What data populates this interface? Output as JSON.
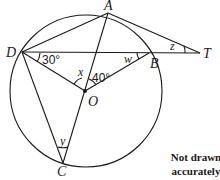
{
  "diagram": {
    "type": "circle-geometry",
    "colors": {
      "stroke": "#1a1a1a",
      "background": "#ffffff"
    },
    "points": {
      "A": {
        "label": "A"
      },
      "B": {
        "label": "B"
      },
      "C": {
        "label": "C"
      },
      "D": {
        "label": "D"
      },
      "O": {
        "label": "O"
      },
      "T": {
        "label": "T"
      }
    },
    "angles": {
      "BDO": "30°",
      "AOB": "40°",
      "x": "x",
      "w": "w",
      "y": "y",
      "z": "z"
    },
    "segments": [
      "DA",
      "AT",
      "DT",
      "DO",
      "OB",
      "AC",
      "DC"
    ],
    "note": "Not drawn accurately"
  }
}
